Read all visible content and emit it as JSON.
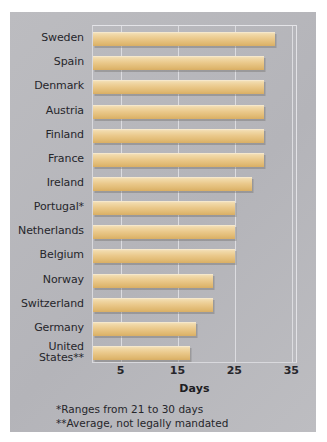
{
  "chart_data": {
    "type": "bar",
    "orientation": "horizontal",
    "title": "",
    "xlabel": "Days",
    "ylabel": "",
    "categories": [
      "Sweden",
      "Spain",
      "Denmark",
      "Austria",
      "Finland",
      "France",
      "Ireland",
      "Portugal*",
      "Netherlands",
      "Belgium",
      "Norway",
      "Switzerland",
      "Germany",
      "United States**"
    ],
    "values": [
      32,
      30,
      30,
      30,
      30,
      30,
      28,
      25,
      25,
      25,
      21,
      21,
      18,
      17
    ],
    "xlim": [
      0,
      36
    ],
    "xticks": [
      5,
      15,
      25,
      35
    ],
    "xtick_labels": [
      "5",
      "15",
      "25",
      "35"
    ],
    "grid": "vertical",
    "legend": "none",
    "bar_color": "#eac88a",
    "background_color": "#b9b9bd",
    "annotations": [
      "*Ranges from 21 to 30 days",
      "**Average, not legally mandated"
    ]
  },
  "axis": {
    "x_title": "Days",
    "ticks": [
      {
        "label": "5",
        "value": 5
      },
      {
        "label": "15",
        "value": 15
      },
      {
        "label": "25",
        "value": 25
      },
      {
        "label": "35",
        "value": 35
      }
    ]
  },
  "categories": [
    {
      "label": "Sweden",
      "value": 32,
      "line1": "Sweden",
      "line2": ""
    },
    {
      "label": "Spain",
      "value": 30,
      "line1": "Spain",
      "line2": ""
    },
    {
      "label": "Denmark",
      "value": 30,
      "line1": "Denmark",
      "line2": ""
    },
    {
      "label": "Austria",
      "value": 30,
      "line1": "Austria",
      "line2": ""
    },
    {
      "label": "Finland",
      "value": 30,
      "line1": "Finland",
      "line2": ""
    },
    {
      "label": "France",
      "value": 30,
      "line1": "France",
      "line2": ""
    },
    {
      "label": "Ireland",
      "value": 28,
      "line1": "Ireland",
      "line2": ""
    },
    {
      "label": "Portugal*",
      "value": 25,
      "line1": "Portugal*",
      "line2": ""
    },
    {
      "label": "Netherlands",
      "value": 25,
      "line1": "Netherlands",
      "line2": ""
    },
    {
      "label": "Belgium",
      "value": 25,
      "line1": "Belgium",
      "line2": ""
    },
    {
      "label": "Norway",
      "value": 21,
      "line1": "Norway",
      "line2": ""
    },
    {
      "label": "Switzerland",
      "value": 21,
      "line1": "Switzerland",
      "line2": ""
    },
    {
      "label": "Germany",
      "value": 18,
      "line1": "Germany",
      "line2": ""
    },
    {
      "label": "United States**",
      "value": 17,
      "line1": "United",
      "line2": "States**"
    }
  ],
  "footnotes": {
    "one": "*Ranges from 21 to 30 days",
    "two": "**Average, not legally mandated"
  }
}
